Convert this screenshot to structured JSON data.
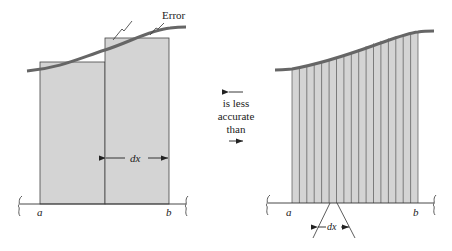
{
  "left_panel": {
    "error_label": "Error",
    "dx_label": "dx",
    "a_label": "a",
    "b_label": "b",
    "num_rectangles": 2
  },
  "middle": {
    "line1": "is less",
    "line2": "accurate",
    "line3": "than"
  },
  "right_panel": {
    "dx_label": "dx",
    "a_label": "a",
    "b_label": "b",
    "num_strips": 17
  },
  "colors": {
    "fill": "#d4d4d4",
    "curve": "#666666",
    "line": "#333333"
  }
}
